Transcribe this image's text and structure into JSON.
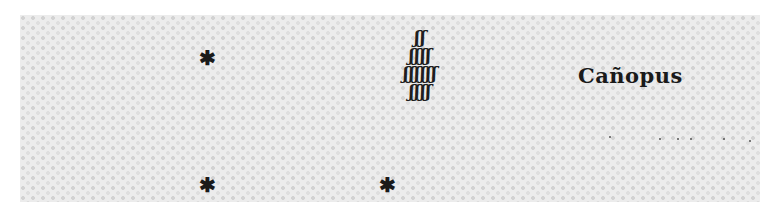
{
  "figure": {
    "label": "Cañopus",
    "glyph_rows": [
      "ʃʃ",
      "ʃʃʃʃ",
      "ʃʃʃʃʃʃ",
      "ʃʃʃʃ"
    ],
    "star_glyph": "✱",
    "stars": [
      {
        "name": "star-left-upper",
        "x": 207,
        "y": 58
      },
      {
        "name": "star-left-lower",
        "x": 207,
        "y": 185
      },
      {
        "name": "star-center-lower",
        "x": 387,
        "y": 185
      }
    ],
    "dots": [
      {
        "x": 609,
        "y": 136
      },
      {
        "x": 659,
        "y": 138
      },
      {
        "x": 677,
        "y": 138
      },
      {
        "x": 690,
        "y": 138
      },
      {
        "x": 723,
        "y": 138
      },
      {
        "x": 749,
        "y": 140
      }
    ],
    "colors": {
      "ink": "#1a1a1a",
      "paper": "#ececec",
      "background": "#ffffff"
    }
  }
}
